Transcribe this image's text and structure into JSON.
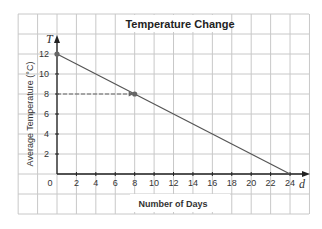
{
  "chart_data": {
    "type": "line",
    "title": "Temperature Change",
    "xlabel": "Number of Days",
    "ylabel": "Average Temperature (°C)",
    "x_var": "d",
    "y_var": "T",
    "origin_label": "0",
    "xlim": [
      0,
      24
    ],
    "ylim": [
      0,
      12
    ],
    "x_ticks": [
      2,
      4,
      6,
      8,
      10,
      12,
      14,
      16,
      18,
      20,
      22,
      24
    ],
    "y_ticks": [
      2,
      4,
      6,
      8,
      10,
      12
    ],
    "grid": true,
    "series": [
      {
        "name": "Temperature",
        "x": [
          0,
          24
        ],
        "y": [
          12,
          0
        ],
        "color": "#555555"
      }
    ],
    "points": [
      {
        "x": 0,
        "y": 12
      },
      {
        "x": 8,
        "y": 8
      }
    ],
    "annotations": [
      {
        "type": "dashed-arrow",
        "from": [
          0,
          8
        ],
        "to": [
          8,
          8
        ]
      }
    ]
  },
  "colors": {
    "grid": "#c8c8c8",
    "axis": "#222222",
    "line": "#555555",
    "dash": "#666666"
  }
}
